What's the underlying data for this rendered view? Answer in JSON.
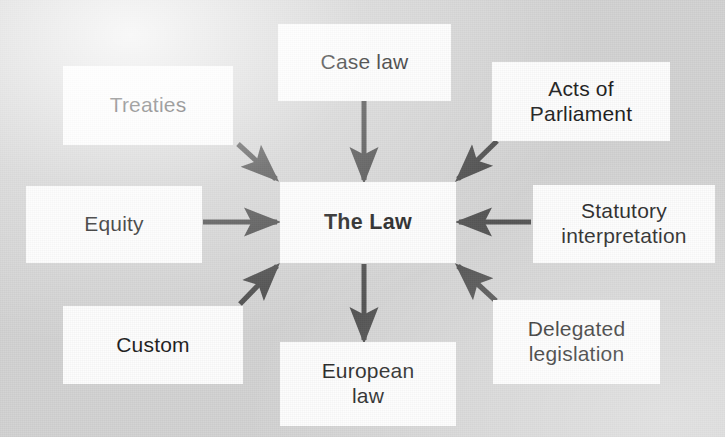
{
  "diagram": {
    "type": "hub-and-spoke concept map",
    "background_color": "#d2d2d2",
    "node_fill_color": "#fdfdfd",
    "node_text_color": "#1d1d1d",
    "arrow_color": "#4a4a4a",
    "center": {
      "id": "the-law",
      "label": "The Law",
      "bold": true,
      "x": 280,
      "y": 182,
      "w": 176,
      "h": 81
    },
    "nodes": [
      {
        "id": "treaties",
        "label": "Treaties",
        "position": "top-left",
        "x": 63,
        "y": 66,
        "w": 170,
        "h": 79
      },
      {
        "id": "case-law",
        "label": "Case law",
        "position": "top-center",
        "x": 278,
        "y": 24,
        "w": 173,
        "h": 77
      },
      {
        "id": "acts-of-parliament",
        "label": "Acts of\nParliament",
        "position": "top-right",
        "x": 492,
        "y": 62,
        "w": 178,
        "h": 79
      },
      {
        "id": "equity",
        "label": "Equity",
        "position": "middle-left",
        "x": 26,
        "y": 186,
        "w": 176,
        "h": 77
      },
      {
        "id": "statutory-interpretation",
        "label": "Statutory\ninterpretation",
        "position": "middle-right",
        "x": 533,
        "y": 185,
        "w": 182,
        "h": 78
      },
      {
        "id": "custom",
        "label": "Custom",
        "position": "bottom-left",
        "x": 63,
        "y": 306,
        "w": 180,
        "h": 78
      },
      {
        "id": "european-law",
        "label": "European\nlaw",
        "position": "bottom-center",
        "x": 280,
        "y": 342,
        "w": 176,
        "h": 84
      },
      {
        "id": "delegated-legislation",
        "label": "Delegated\nlegislation",
        "position": "bottom-right",
        "x": 493,
        "y": 300,
        "w": 167,
        "h": 84
      }
    ],
    "arrows": [
      {
        "id": "treaties-to-law",
        "from": "treaties",
        "to": "the-law",
        "direction": "down-right"
      },
      {
        "id": "case-law-to-law",
        "from": "case-law",
        "to": "the-law",
        "direction": "down"
      },
      {
        "id": "acts-of-parliament-to-law",
        "from": "acts-of-parliament",
        "to": "the-law",
        "direction": "down-left"
      },
      {
        "id": "equity-to-law",
        "from": "equity",
        "to": "the-law",
        "direction": "right"
      },
      {
        "id": "statutory-interpretation-to-law",
        "from": "statutory-interpretation",
        "to": "the-law",
        "direction": "left"
      },
      {
        "id": "custom-to-law",
        "from": "custom",
        "to": "the-law",
        "direction": "up-right"
      },
      {
        "id": "delegated-legislation-to-law",
        "from": "delegated-legislation",
        "to": "the-law",
        "direction": "up-left"
      },
      {
        "id": "law-to-european-law",
        "from": "the-law",
        "to": "european-law",
        "direction": "down"
      }
    ]
  }
}
